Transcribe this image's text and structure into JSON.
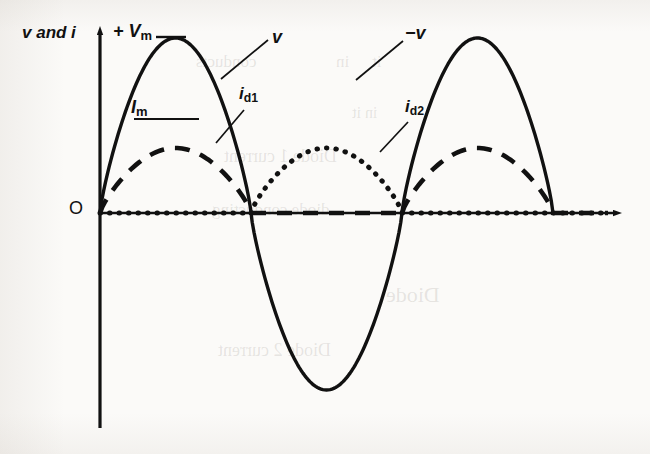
{
  "figure": {
    "background_color": "#fbfaf8",
    "ink_color": "#111111"
  },
  "labels": {
    "y_axis": "v and i",
    "v_max": "+ V",
    "v_max_sub": "m",
    "i_max": "I",
    "i_max_sub": "m",
    "voltage": "v",
    "voltage_negative": "−v",
    "diode1_current": "i",
    "diode1_current_sub": "d1",
    "diode2_current": "i",
    "diode2_current_sub": "d2",
    "origin": "O"
  },
  "ghost_text": [
    {
      "text": "conducts",
      "x": 196,
      "y": 52,
      "size": 17
    },
    {
      "text": "in",
      "x": 336,
      "y": 52,
      "size": 17
    },
    {
      "text": "it",
      "x": 372,
      "y": 52,
      "size": 17
    },
    {
      "text": "Diode 1 current",
      "x": 224,
      "y": 146,
      "size": 18
    },
    {
      "text": "Diode 2 current",
      "x": 218,
      "y": 340,
      "size": 18
    },
    {
      "text": "diode conducting",
      "x": 212,
      "y": 200,
      "size": 17
    },
    {
      "text": "Diode",
      "x": 386,
      "y": 282,
      "size": 22
    },
    {
      "text": "in it",
      "x": 352,
      "y": 104,
      "size": 16
    }
  ],
  "chart_data": {
    "type": "line",
    "xlabel": "",
    "ylabel": "v and i",
    "grid": false,
    "legend": "inline-annotations",
    "axes": {
      "x_axis_y_px": 213,
      "y_axis_x_px": 100,
      "x_axis_arrow_end_px": 620,
      "y_axis_arrow_top_px": 28,
      "y_axis_bottom_px": 428,
      "half_cycle_width_px": 151,
      "zero_crossings_px": [
        100,
        251,
        402,
        553
      ],
      "v_peak_y_px": 38,
      "v_trough_y_px": 390,
      "i_peak_y_px": 148
    },
    "x_range_cycles": [
      0,
      1.5
    ],
    "series": [
      {
        "name": "v",
        "label": "v",
        "style": "solid",
        "description": "Full sinusoidal supply voltage, amplitude +Vm to -Vm, three half-cycles shown",
        "waveform": "sine",
        "amplitude_label": "+ V_m",
        "points_norm": [
          {
            "phase": 0.0,
            "value": 0
          },
          {
            "phase": 0.5,
            "value": 1
          },
          {
            "phase": 1.0,
            "value": 0
          },
          {
            "phase": 1.5,
            "value": -1
          },
          {
            "phase": 2.0,
            "value": 0
          },
          {
            "phase": 2.5,
            "value": 1
          },
          {
            "phase": 3.0,
            "value": 0
          },
          {
            "phase": 3.5,
            "value": -1
          },
          {
            "phase": 4.0,
            "value": 0
          },
          {
            "phase": 4.5,
            "value": 1
          },
          {
            "phase": 5.0,
            "value": 0
          },
          {
            "phase": 5.5,
            "value": -1
          },
          {
            "phase": 6.0,
            "value": 0
          }
        ]
      },
      {
        "name": "i_d1",
        "label": "i_d1",
        "style": "dashed",
        "description": "Diode 1 current: positive half sine during half-cycles 1 and 3, zero elsewhere",
        "amplitude_label": "I_m",
        "conducting_half_cycles": [
          1,
          3
        ],
        "peak_value_norm": 0.43
      },
      {
        "name": "i_d2",
        "label": "i_d2",
        "style": "dotted",
        "description": "Diode 2 current: positive half sine during half-cycle 2, zero elsewhere",
        "amplitude_label": "I_m",
        "conducting_half_cycles": [
          2
        ],
        "peak_value_norm": 0.43
      }
    ],
    "annotations": [
      {
        "text": "+ V_m",
        "target": "peak of first positive half-cycle of v"
      },
      {
        "text": "I_m",
        "target": "peak of first dashed diode-1 current pulse"
      },
      {
        "text": "v",
        "target": "falling edge of first positive half-cycle"
      },
      {
        "text": "i_d1",
        "target": "falling edge of first dashed current pulse"
      },
      {
        "text": "i_d2",
        "target": "falling edge of dotted current pulse"
      },
      {
        "text": "−v",
        "target": "rising edge of second positive half-cycle"
      },
      {
        "text": "O",
        "target": "origin"
      }
    ]
  }
}
